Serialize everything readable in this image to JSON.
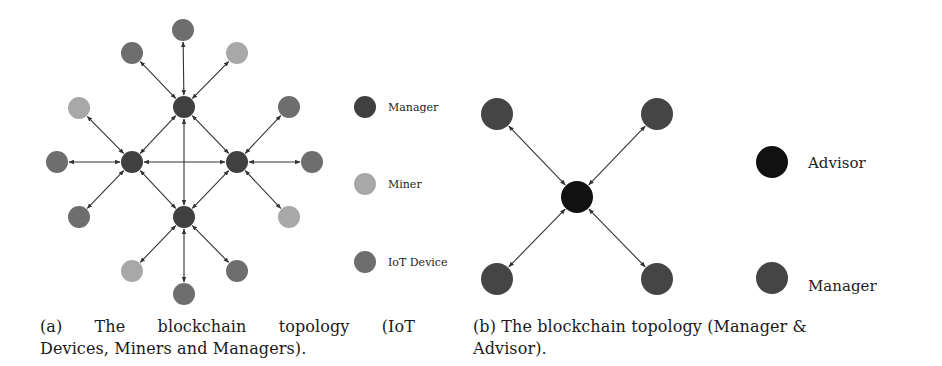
{
  "figure_a": {
    "caption": "(a) The blockchain topology (IoT Devices, Miners and Managers).",
    "caption_line1": "(a) The blockchain topology (IoT",
    "caption_line2": "Devices, Miners and Managers).",
    "node_radius": 11,
    "colors": {
      "manager": "#404040",
      "miner": "#a8a8a8",
      "iot": "#6e6e6e",
      "edge": "#333333"
    },
    "nodes": [
      {
        "id": "m_top",
        "type": "manager",
        "x": 184,
        "y": 107
      },
      {
        "id": "m_left",
        "type": "manager",
        "x": 132,
        "y": 162
      },
      {
        "id": "m_right",
        "type": "manager",
        "x": 237,
        "y": 162
      },
      {
        "id": "m_bottom",
        "type": "manager",
        "x": 184,
        "y": 217
      },
      {
        "id": "n1",
        "type": "iot",
        "x": 183,
        "y": 30
      },
      {
        "id": "n2",
        "type": "iot",
        "x": 132,
        "y": 53
      },
      {
        "id": "n3",
        "type": "miner",
        "x": 237,
        "y": 53
      },
      {
        "id": "n4",
        "type": "miner",
        "x": 79,
        "y": 108
      },
      {
        "id": "n5",
        "type": "iot",
        "x": 289,
        "y": 107
      },
      {
        "id": "n6",
        "type": "iot",
        "x": 57,
        "y": 162
      },
      {
        "id": "n7",
        "type": "iot",
        "x": 312,
        "y": 162
      },
      {
        "id": "n8",
        "type": "iot",
        "x": 79,
        "y": 217
      },
      {
        "id": "n9",
        "type": "miner",
        "x": 289,
        "y": 217
      },
      {
        "id": "n10",
        "type": "miner",
        "x": 132,
        "y": 271
      },
      {
        "id": "n11",
        "type": "iot",
        "x": 237,
        "y": 271
      },
      {
        "id": "n12",
        "type": "iot",
        "x": 184,
        "y": 294
      }
    ],
    "edges": [
      [
        "m_top",
        "n1"
      ],
      [
        "m_top",
        "n2"
      ],
      [
        "m_top",
        "n3"
      ],
      [
        "m_left",
        "n4"
      ],
      [
        "m_left",
        "n6"
      ],
      [
        "m_left",
        "n8"
      ],
      [
        "m_right",
        "n5"
      ],
      [
        "m_right",
        "n7"
      ],
      [
        "m_right",
        "n9"
      ],
      [
        "m_bottom",
        "n10"
      ],
      [
        "m_bottom",
        "n11"
      ],
      [
        "m_bottom",
        "n12"
      ],
      [
        "m_top",
        "m_left"
      ],
      [
        "m_top",
        "m_right"
      ],
      [
        "m_top",
        "m_bottom"
      ],
      [
        "m_left",
        "m_right"
      ],
      [
        "m_left",
        "m_bottom"
      ],
      [
        "m_right",
        "m_bottom"
      ]
    ],
    "legend": [
      {
        "label": "Manager",
        "type": "manager",
        "x": 365,
        "y": 107
      },
      {
        "label": "Miner",
        "type": "miner",
        "x": 365,
        "y": 184
      },
      {
        "label": "IoT Device",
        "type": "iot",
        "x": 365,
        "y": 262
      }
    ]
  },
  "figure_b": {
    "caption": "(b) The blockchain topology (Manager & Advisor).",
    "caption_line1": "(b) The blockchain topology (Manager &",
    "caption_line2": "Advisor).",
    "node_radius": 16,
    "colors": {
      "advisor": "#111111",
      "manager": "#454545",
      "edge": "#333333"
    },
    "nodes": [
      {
        "id": "advisor",
        "type": "advisor",
        "x": 577,
        "y": 197
      },
      {
        "id": "mgr_tl",
        "type": "manager",
        "x": 497,
        "y": 114
      },
      {
        "id": "mgr_tr",
        "type": "manager",
        "x": 657,
        "y": 114
      },
      {
        "id": "mgr_bl",
        "type": "manager",
        "x": 497,
        "y": 279
      },
      {
        "id": "mgr_br",
        "type": "manager",
        "x": 657,
        "y": 279
      }
    ],
    "edges": [
      [
        "advisor",
        "mgr_tl"
      ],
      [
        "advisor",
        "mgr_tr"
      ],
      [
        "advisor",
        "mgr_bl"
      ],
      [
        "advisor",
        "mgr_br"
      ]
    ],
    "legend": [
      {
        "label": "Advisor",
        "type": "advisor",
        "x": 772,
        "y": 162,
        "text_y": 168
      },
      {
        "label": "Manager",
        "type": "manager",
        "x": 772,
        "y": 278,
        "text_y": 291
      }
    ]
  }
}
